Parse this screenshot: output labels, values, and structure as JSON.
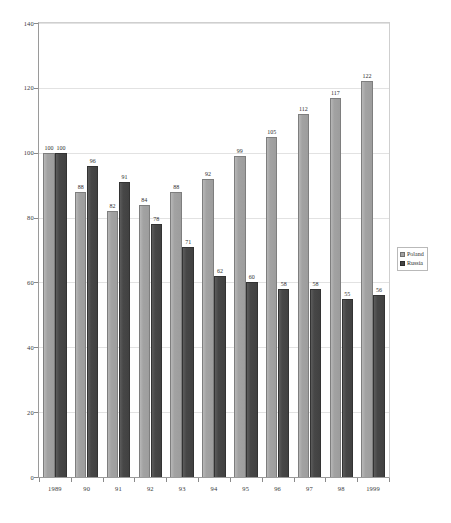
{
  "chart_data": {
    "type": "bar",
    "title": "",
    "subtitle": "",
    "xlabel": "",
    "ylabel": "",
    "grid": true,
    "legend_position": "right",
    "ylim": [
      0,
      140
    ],
    "yticks": [
      0,
      20,
      40,
      60,
      80,
      100,
      120,
      140
    ],
    "ytick_labels": [
      "0",
      "20",
      "40",
      "60",
      "80",
      "100",
      "120",
      "140"
    ],
    "categories": [
      "1989",
      "90",
      "91",
      "92",
      "93",
      "94",
      "95",
      "96",
      "97",
      "98",
      "1999"
    ],
    "series": [
      {
        "name": "Poland",
        "color": "#a2a2a2",
        "values": [
          100,
          88,
          82,
          84,
          88,
          92,
          99,
          105,
          112,
          117,
          122
        ],
        "labels": [
          "100",
          "88",
          "82",
          "84",
          "88",
          "92",
          "99",
          "105",
          "112",
          "117",
          "122"
        ]
      },
      {
        "name": "Russia",
        "color": "#454545",
        "values": [
          100,
          96,
          91,
          78,
          71,
          62,
          60,
          58,
          58,
          55,
          56
        ],
        "labels": [
          "100",
          "96",
          "91",
          "78",
          "71",
          "62",
          "60",
          "58",
          "58",
          "55",
          "56"
        ]
      }
    ]
  },
  "legend": {
    "items": [
      {
        "label": "Poland",
        "swatch": "poland"
      },
      {
        "label": "Russia",
        "swatch": "russia"
      }
    ]
  }
}
